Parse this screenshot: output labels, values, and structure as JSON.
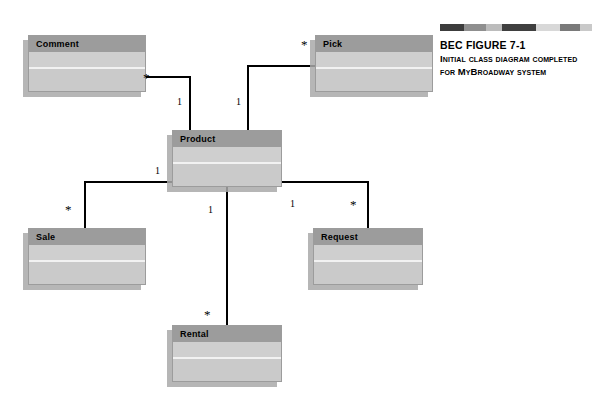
{
  "figure": {
    "id": "BEC FIGURE 7-1",
    "caption_line1": "Initial class diagram completed",
    "caption_line2": "for MyBroadway system",
    "gradient_bar": "decorative-gradient-bar"
  },
  "colors": {
    "box_header": "#9c9c9c",
    "box_body": "#d2d2d2",
    "box_attributes": "#cfcfcf",
    "box_operations": "#cacaca",
    "box_border": "#9c9c9c",
    "box_shadow": "#a9a9a9",
    "connector_line": "#000000",
    "page_background": "#ffffff"
  },
  "diagram": {
    "type": "uml-class-diagram",
    "classes": [
      {
        "key": "comment",
        "name": "Comment",
        "x": 28,
        "y": 35,
        "w": 118,
        "h": 57
      },
      {
        "key": "pick",
        "name": "Pick",
        "x": 315,
        "y": 35,
        "w": 118,
        "h": 57
      },
      {
        "key": "product",
        "name": "Product",
        "x": 172,
        "y": 130,
        "w": 110,
        "h": 57
      },
      {
        "key": "sale",
        "name": "Sale",
        "x": 28,
        "y": 228,
        "w": 118,
        "h": 57
      },
      {
        "key": "request",
        "name": "Request",
        "x": 313,
        "y": 228,
        "w": 110,
        "h": 57
      },
      {
        "key": "rental",
        "name": "Rental",
        "x": 172,
        "y": 325,
        "w": 110,
        "h": 57
      }
    ],
    "associations": [
      {
        "key": "product-comment",
        "from": "Product",
        "to": "Comment",
        "from_multiplicity": "1",
        "to_multiplicity": "*",
        "from_label_x": 177,
        "from_label_y": 167,
        "to_label_x": 143,
        "to_label_y": 74
      },
      {
        "key": "product-pick",
        "from": "Product",
        "to": "Pick",
        "from_multiplicity": "1",
        "to_multiplicity": "*",
        "from_label_x": 236,
        "from_label_y": 97,
        "to_label_x": 301,
        "to_label_y": 41
      },
      {
        "key": "product-sale",
        "from": "Product",
        "to": "Sale",
        "from_multiplicity": "1",
        "to_multiplicity": "*",
        "from_label_x": 155,
        "from_label_y": 166,
        "to_label_x": 65,
        "to_label_y": 206
      },
      {
        "key": "product-request",
        "from": "Product",
        "to": "Request",
        "from_multiplicity": "1",
        "to_multiplicity": "*",
        "from_label_x": 290,
        "from_label_y": 201,
        "to_label_x": 350,
        "to_label_y": 201
      },
      {
        "key": "product-rental",
        "from": "Product",
        "to": "Rental",
        "from_multiplicity": "1",
        "to_multiplicity": "*",
        "from_label_x": 208,
        "from_label_y": 207,
        "to_label_x": 204,
        "to_label_y": 311
      }
    ]
  }
}
